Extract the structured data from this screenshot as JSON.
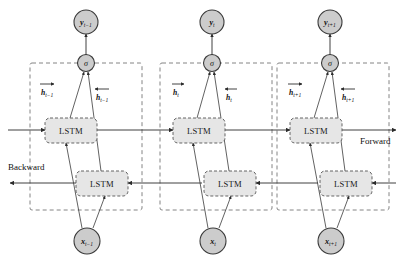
{
  "figure": {
    "type": "bidirectional-lstm-architecture-diagram",
    "background_color": "#ffffff",
    "node_fill_color": "#cccccc",
    "lstm_fill_color": "#e6e6e6",
    "stroke_color": "#2b2b2b",
    "dashed_group_color": "#777777"
  },
  "direction_labels": {
    "backward": "Backward",
    "forward": "Forward"
  },
  "cell_label": "LSTM",
  "activation_label": "σ",
  "timesteps": [
    {
      "id": "t-minus-1",
      "output_base": "y",
      "output_sub": "t−1",
      "input_base": "x",
      "input_sub": "t−1",
      "hidden_forward_base": "h",
      "hidden_forward_sub": "t−1",
      "hidden_backward_base": "h",
      "hidden_backward_sub": "t−1"
    },
    {
      "id": "t",
      "output_base": "y",
      "output_sub": "t",
      "input_base": "x",
      "input_sub": "t",
      "hidden_forward_base": "h",
      "hidden_forward_sub": "t",
      "hidden_backward_base": "h",
      "hidden_backward_sub": "t"
    },
    {
      "id": "t-plus-1",
      "output_base": "y",
      "output_sub": "t+1",
      "input_base": "x",
      "input_sub": "t+1",
      "hidden_forward_base": "h",
      "hidden_forward_sub": "t+1",
      "hidden_backward_base": "h",
      "hidden_backward_sub": "t+1"
    }
  ]
}
